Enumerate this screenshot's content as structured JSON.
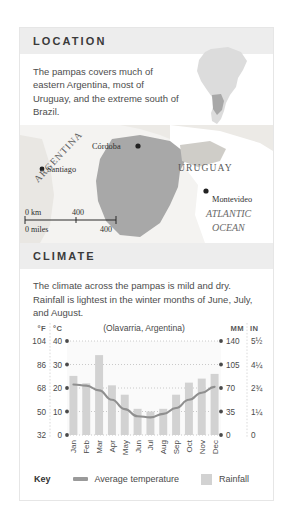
{
  "location": {
    "header": "LOCATION",
    "description": "The pampas covers much of eastern Argentina, most of Uruguay, and the extreme south of Brazil.",
    "inset_icon": "south-america-inset-map"
  },
  "map": {
    "cities": [
      {
        "name": "Córdoba",
        "x": 118,
        "y": 21
      },
      {
        "name": "Santiago",
        "x": 31,
        "y": 44
      },
      {
        "name": "Montevideo",
        "x": 196,
        "y": 70
      }
    ],
    "countries": [
      {
        "name": "ARGENTINA",
        "x": 62,
        "y": 58
      },
      {
        "name": "URUGUAY",
        "x": 182,
        "y": 42
      }
    ],
    "ocean": "ATLANTIC OCEAN",
    "scale": {
      "km_label": "0 km",
      "km_value": "400",
      "miles_label": "0 miles",
      "miles_value": "400"
    }
  },
  "climate": {
    "header": "CLIMATE",
    "description": "The climate across the pampas is mild and dry. Rainfall is lightest in the winter months of June, July, and August.",
    "legend": {
      "key_label": "Key",
      "temperature_label": "Average temperature",
      "rainfall_label": "Rainfall"
    }
  },
  "colors": {
    "header_band": "#ededed",
    "bar": "#d2d2d2",
    "line": "#8f8f8f",
    "text": "#4d4d4d",
    "pampas_region": "#a8a8a8"
  },
  "chart_data": {
    "type": "bar",
    "title": "(Olavarria, Argentina)",
    "categories": [
      "Jan",
      "Feb",
      "Mar",
      "Apr",
      "May",
      "Jun",
      "Jul",
      "Aug",
      "Sep",
      "Oct",
      "Nov",
      "Dec"
    ],
    "series": [
      {
        "name": "Rainfall",
        "type": "bar",
        "unit": "mm",
        "values": [
          88,
          77,
          119,
          74,
          60,
          39,
          35,
          39,
          60,
          78,
          84,
          91
        ]
      },
      {
        "name": "Average temperature",
        "type": "line",
        "unit": "°C",
        "values": [
          21.5,
          21,
          19,
          15,
          11,
          8,
          7.5,
          9,
          11.5,
          15,
          18,
          20.5
        ]
      }
    ],
    "axes": {
      "left_headers": [
        "°F",
        "°C"
      ],
      "right_headers": [
        "MM",
        "IN"
      ],
      "fahrenheit_ticks": [
        "104",
        "86",
        "68",
        "50",
        "32"
      ],
      "celsius_ticks": [
        "40",
        "30",
        "20",
        "10",
        "0"
      ],
      "mm_ticks": [
        "140",
        "105",
        "70",
        "35",
        "0"
      ],
      "in_ticks": [
        "5½",
        "4¼",
        "2¾",
        "1¼",
        "0"
      ],
      "celsius_range": [
        0,
        40
      ],
      "mm_range": [
        0,
        140
      ],
      "grid": true
    },
    "xlabel": "",
    "ylabel": ""
  }
}
